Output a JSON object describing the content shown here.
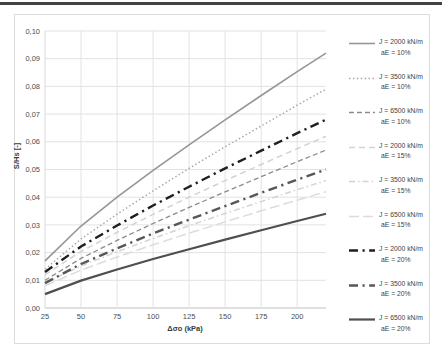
{
  "page": {
    "top_rule_color": "#424242"
  },
  "chart_data": {
    "type": "line",
    "title": "",
    "xlabel": "Δσo (kPa)",
    "ylabel": "S/Hs [-]",
    "xlim": [
      25,
      220
    ],
    "ylim": [
      0,
      0.1
    ],
    "grid": true,
    "legend_position": "right",
    "x_ticks": [
      25,
      50,
      75,
      100,
      125,
      150,
      175,
      200
    ],
    "y_tick_values": [
      0,
      0.01,
      0.02,
      0.03,
      0.04,
      0.05,
      0.06,
      0.07,
      0.08,
      0.09,
      0.1
    ],
    "y_tick_labels": [
      "0,00",
      "0,01",
      "0,02",
      "0,03",
      "0,04",
      "0,05",
      "0,06",
      "0,07",
      "0,08",
      "0,09",
      "0,10"
    ],
    "x": [
      25,
      50,
      75,
      100,
      125,
      150,
      175,
      200,
      220
    ],
    "series": [
      {
        "name": "J = 2000 kN/m aE = 10%",
        "legend_line1": "J = 2000 kN/m",
        "legend_line2": "aE = 10%",
        "color": "#969696",
        "dash": "",
        "width": 1.6,
        "values": [
          0.017,
          0.0296,
          0.04,
          0.0497,
          0.0589,
          0.0679,
          0.0767,
          0.0853,
          0.092
        ]
      },
      {
        "name": "J = 3500 kN/m aE = 10%",
        "legend_line1": "J = 3500 kN/m",
        "legend_line2": "aE = 10%",
        "color": "#a6a6a6",
        "dash": "1.5 2.4",
        "width": 1.4,
        "values": [
          0.014,
          0.0249,
          0.0339,
          0.0423,
          0.0504,
          0.0582,
          0.0657,
          0.0732,
          0.079
        ]
      },
      {
        "name": "J = 6500 kN/m aE = 10%",
        "legend_line1": "J = 6500 kN/m",
        "legend_line2": "aE = 10%",
        "color": "#8c8c8c",
        "dash": "5 3",
        "width": 1.3,
        "values": [
          0.01,
          0.0179,
          0.0244,
          0.0305,
          0.0363,
          0.0419,
          0.0474,
          0.0528,
          0.057
        ]
      },
      {
        "name": "J = 2000 kN/m aE = 15%",
        "legend_line1": "J = 2000 kN/m",
        "legend_line2": "aE = 15%",
        "color": "#d3d3d3",
        "dash": "6 4",
        "width": 1.5,
        "values": [
          0.012,
          0.0204,
          0.0273,
          0.0338,
          0.04,
          0.046,
          0.0518,
          0.0575,
          0.062
        ]
      },
      {
        "name": "J = 3500 kN/m aE = 15%",
        "legend_line1": "J = 3500 kN/m",
        "legend_line2": "aE = 15%",
        "color": "#d3d3d3",
        "dash": "6 3 1.5 3",
        "width": 1.5,
        "values": [
          0.009,
          0.0152,
          0.0203,
          0.0251,
          0.0297,
          0.0341,
          0.0384,
          0.0427,
          0.046
        ]
      },
      {
        "name": "J = 6500 kN/m aE = 15%",
        "legend_line1": "J = 6500 kN/m",
        "legend_line2": "aE = 15%",
        "color": "#dcdcdc",
        "dash": "10 4",
        "width": 1.5,
        "values": [
          0.008,
          0.0137,
          0.0184,
          0.0228,
          0.027,
          0.0311,
          0.0351,
          0.0389,
          0.042
        ]
      },
      {
        "name": "J = 2000 kN/m aE = 20%",
        "legend_line1": "J = 2000 kN/m",
        "legend_line2": "aE = 20%",
        "color": "#1f1f1f",
        "dash": "9 4.5 2.2 4.5",
        "width": 2.4,
        "values": [
          0.013,
          0.0222,
          0.0298,
          0.037,
          0.0438,
          0.0504,
          0.0568,
          0.0631,
          0.068
        ]
      },
      {
        "name": "J = 3500 kN/m aE = 20%",
        "legend_line1": "J = 3500 kN/m",
        "legend_line2": "aE = 20%",
        "color": "#575757",
        "dash": "9 4.5 2.2 4.5",
        "width": 2.4,
        "values": [
          0.009,
          0.0159,
          0.0215,
          0.0269,
          0.0319,
          0.0368,
          0.0416,
          0.0463,
          0.05
        ]
      },
      {
        "name": "J = 6500 kN/m aE = 20%",
        "legend_line1": "J = 6500 kN/m",
        "legend_line2": "aE = 20%",
        "color": "#4f4f4f",
        "dash": "",
        "width": 2.2,
        "values": [
          0.005,
          0.0099,
          0.0139,
          0.0177,
          0.0212,
          0.0247,
          0.0281,
          0.0314,
          0.034
        ]
      }
    ]
  }
}
